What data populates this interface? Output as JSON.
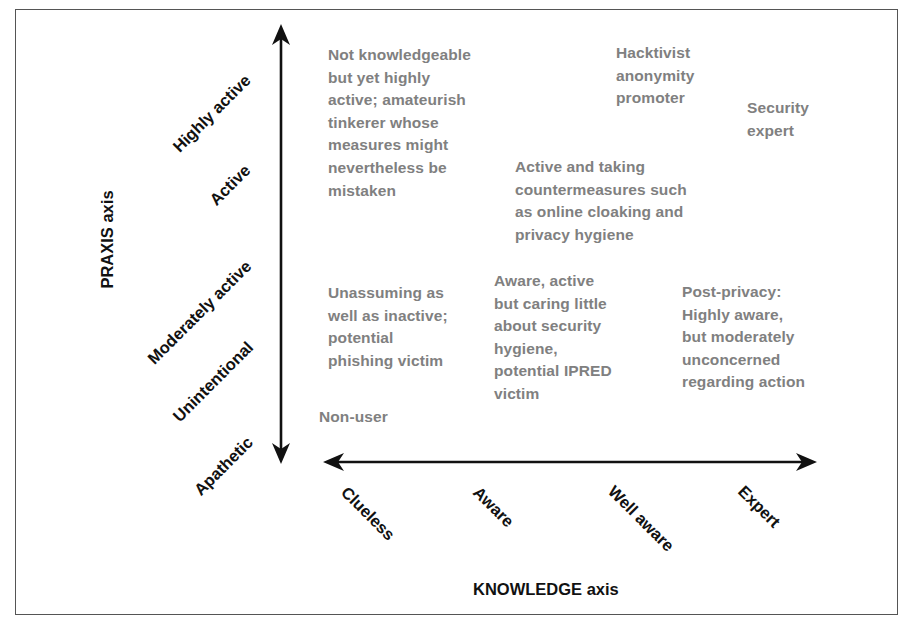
{
  "diagram": {
    "y_axis": {
      "title": "PRAXIS axis",
      "levels": [
        "Highly active",
        "Active",
        "Moderately active",
        "Unintentional",
        "Apathetic"
      ]
    },
    "x_axis": {
      "title": "KNOWLEDGE axis",
      "levels": [
        "Clueless",
        "Aware",
        "Well aware",
        "Expert"
      ]
    },
    "cells": [
      {
        "id": "tinkerer",
        "text": "Not knowledgeable\nbut yet highly\nactive; amateurish\ntinkerer whose\nmeasures might\nnevertheless be\nmistaken"
      },
      {
        "id": "hacktivist",
        "text": "Hacktivist\nanonymity\npromoter"
      },
      {
        "id": "security-expert",
        "text": "Security\nexpert"
      },
      {
        "id": "countermeasures",
        "text": "Active and taking\ncountermeasures such\nas online cloaking and\nprivacy hygiene"
      },
      {
        "id": "unassuming",
        "text": "Unassuming as\nwell as inactive;\npotential\nphishing victim"
      },
      {
        "id": "aware-active",
        "text": "Aware, active\nbut caring little\nabout security\nhygiene,\npotential IPRED\nvictim"
      },
      {
        "id": "post-privacy",
        "text": "Post-privacy:\nHighly aware,\nbut moderately\nunconcerned\nregarding action"
      },
      {
        "id": "non-user",
        "text": "Non-user"
      }
    ],
    "colors": {
      "axis": "#111111",
      "cell_text": "#808080",
      "frame": "#555555"
    }
  }
}
